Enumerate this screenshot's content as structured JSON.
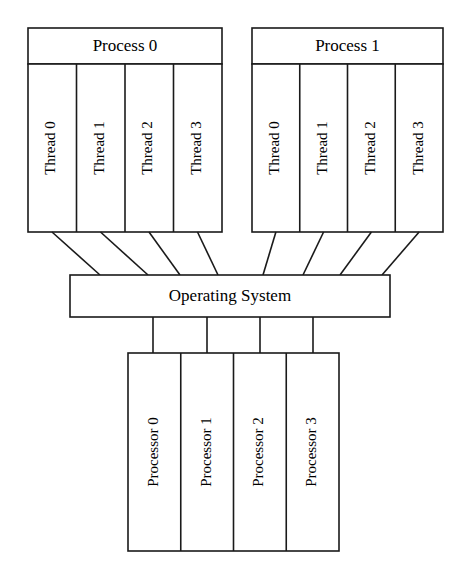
{
  "diagram": {
    "type": "block-diagram",
    "orientation": "top-down",
    "background_color": "#ffffff",
    "line_color": "#1a1a1a",
    "text_color": "#000000"
  },
  "processes": [
    {
      "label": "Process 0",
      "threads": [
        {
          "label": "Thread 0"
        },
        {
          "label": "Thread 1"
        },
        {
          "label": "Thread 2"
        },
        {
          "label": "Thread 3"
        }
      ]
    },
    {
      "label": "Process 1",
      "threads": [
        {
          "label": "Thread 0"
        },
        {
          "label": "Thread 1"
        },
        {
          "label": "Thread 2"
        },
        {
          "label": "Thread 3"
        }
      ]
    }
  ],
  "operating_system": {
    "label": "Operating System"
  },
  "processors": [
    {
      "label": "Processor 0"
    },
    {
      "label": "Processor 1"
    },
    {
      "label": "Processor 2"
    },
    {
      "label": "Processor 3"
    }
  ],
  "connections": {
    "threads_to_os_count": 8,
    "os_to_processors_count": 4,
    "style": "plain-lines-no-arrowheads"
  }
}
